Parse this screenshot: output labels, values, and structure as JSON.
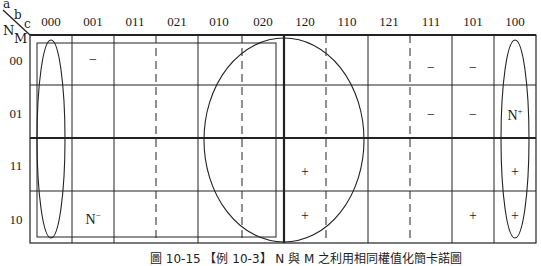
{
  "corner": {
    "a": "a",
    "b": "b",
    "c": "c",
    "n": "N",
    "m": "M"
  },
  "columns": [
    "000",
    "001",
    "011",
    "021",
    "010",
    "020",
    "120",
    "110",
    "121",
    "111",
    "101",
    "100"
  ],
  "rows": [
    "00",
    "01",
    "11",
    "10"
  ],
  "marks": [
    {
      "row": 0,
      "col": 1,
      "text": "−"
    },
    {
      "row": 0,
      "col": 9,
      "text": "−"
    },
    {
      "row": 0,
      "col": 10,
      "text": "−"
    },
    {
      "row": 1,
      "col": 9,
      "text": "−"
    },
    {
      "row": 1,
      "col": 10,
      "text": "−"
    },
    {
      "row": 1,
      "col": 11,
      "text": "N",
      "sup": "+"
    },
    {
      "row": 2,
      "col": 6,
      "text": "+"
    },
    {
      "row": 2,
      "col": 11,
      "text": "+"
    },
    {
      "row": 3,
      "col": 1,
      "text": "N",
      "sup": "−"
    },
    {
      "row": 3,
      "col": 6,
      "text": "+"
    },
    {
      "row": 3,
      "col": 10,
      "text": "+"
    },
    {
      "row": 3,
      "col": 11,
      "text": "+"
    }
  ],
  "caption": "圖 10-15 【例 10-3】 N 與 M 之利用相同權值化簡卡諾圖"
}
